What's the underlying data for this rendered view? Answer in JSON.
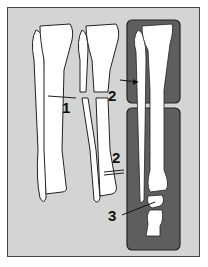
{
  "figure": {
    "type": "anatomical-diagram",
    "colors": {
      "background": "#d4d4d4",
      "panel_dark": "#5e5e5e",
      "bone": "#ffffff",
      "outline": "#222222"
    },
    "bone_labels": [
      "T",
      "T",
      "T"
    ],
    "callouts": [
      {
        "id": "1",
        "text": "1"
      },
      {
        "id": "2a",
        "text": "2"
      },
      {
        "id": "2b",
        "text": "2"
      },
      {
        "id": "3",
        "text": "3"
      }
    ]
  }
}
